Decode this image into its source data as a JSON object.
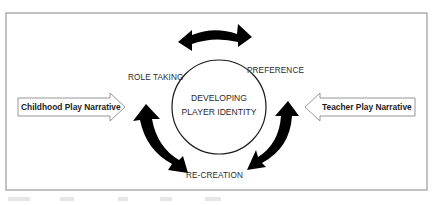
{
  "diagram": {
    "center": {
      "line1": "DEVELOPING",
      "line2": "PLAYER IDENTITY"
    },
    "nodes": {
      "role_taking": "ROLE TAKING",
      "preference": "PREFERENCE",
      "re_creation": "RE-CREATION"
    },
    "inputs": {
      "left": "Childhood Play Narrative",
      "right": "Teacher Play Narrative"
    },
    "arrows": [
      {
        "name": "top",
        "between": [
          "ROLE TAKING",
          "PREFERENCE"
        ],
        "type": "double-headed-curved"
      },
      {
        "name": "left",
        "between": [
          "ROLE TAKING",
          "RE-CREATION"
        ],
        "type": "double-headed-curved"
      },
      {
        "name": "right",
        "between": [
          "PREFERENCE",
          "RE-CREATION"
        ],
        "type": "double-headed-curved"
      }
    ],
    "colors": {
      "frame": "#a8a8a8",
      "arrow_fill": "#000000",
      "text": "#2a2a2a",
      "outline_arrow": "#8a8a8a"
    }
  }
}
